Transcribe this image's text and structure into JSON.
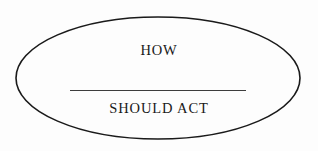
{
  "figure": {
    "type": "diagram",
    "shape": "ellipse",
    "background_color": "#fefefe",
    "stroke_color": "#1a1a1a",
    "text_color": "#1a1a1a",
    "rule_color": "#3d3d3d"
  },
  "ellipse": {
    "center_x": 158,
    "center_y": 78,
    "radius_x": 142,
    "radius_y": 61,
    "stroke_width": 1.6,
    "fill": "none"
  },
  "fraction": {
    "numerator": "HOW",
    "denominator": "SHOULD ACT",
    "bar_left": 70,
    "bar_right": 246,
    "bar_y": 91
  }
}
